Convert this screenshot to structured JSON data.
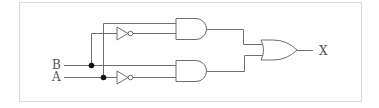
{
  "diagram": {
    "type": "logic-circuit",
    "inputs": [
      {
        "label": "B"
      },
      {
        "label": "A"
      }
    ],
    "output": {
      "label": "X"
    },
    "gates": [
      {
        "id": "not1",
        "type": "NOT",
        "input": "B"
      },
      {
        "id": "not2",
        "type": "NOT",
        "input": "A"
      },
      {
        "id": "and1",
        "type": "AND",
        "inputs": [
          "A",
          "NOT B"
        ]
      },
      {
        "id": "and2",
        "type": "AND",
        "inputs": [
          "B",
          "NOT A"
        ]
      },
      {
        "id": "or1",
        "type": "OR",
        "inputs": [
          "and1",
          "and2"
        ],
        "output": "X"
      }
    ],
    "colors": {
      "wire": "#6e6e6e",
      "junction": "#111111",
      "frame": "#b0b0b0",
      "text": "#555555"
    }
  }
}
